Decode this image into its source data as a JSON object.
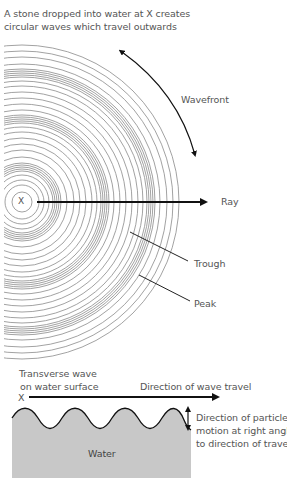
{
  "top": {
    "caption_line1": "A stone dropped into water at X creates",
    "caption_line2": "circular waves which travel outwards",
    "center_label": "X",
    "labels": {
      "wavefront": "Wavefront",
      "ray": "Ray",
      "trough": "Trough",
      "peak": "Peak"
    }
  },
  "bottom": {
    "title_line1": "Transverse wave",
    "title_line2": "on water surface",
    "origin_label": "X",
    "travel_label": "Direction of wave travel",
    "motion_line1": "Direction of particle",
    "motion_line2": "motion at right angles",
    "motion_line3": "to direction of travel",
    "water_label": "Water"
  },
  "colors": {
    "ring": "#8a8a8a",
    "arrow": "#111111",
    "water_fill": "#c8c8c8",
    "text": "#555555"
  },
  "icons": {
    "center_marker": "x-mark",
    "ray_arrow": "arrow-right",
    "wavefront_arrow": "double-headed-curved-arrow",
    "motion_arrow": "double-headed-vertical-arrow"
  }
}
